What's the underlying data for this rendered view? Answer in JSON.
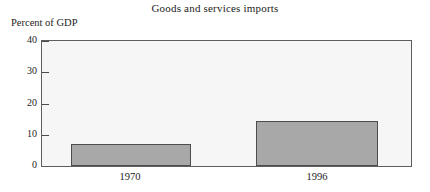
{
  "chart_data": {
    "type": "bar",
    "title": "Goods and services imports",
    "xlabel": "",
    "ylabel": "Percent of GDP",
    "categories": [
      "1970",
      "1996"
    ],
    "values": [
      7,
      14.4
    ],
    "ylim": [
      0,
      40
    ],
    "yticks": [
      0,
      10,
      20,
      30,
      40
    ],
    "ytick_labels": [
      "0",
      "10",
      "20",
      "30",
      "40"
    ],
    "grid": false,
    "legend": "none",
    "series": [
      {
        "name": "Goods and services imports",
        "values": [
          7,
          14.4
        ]
      }
    ],
    "colors": {
      "bar_fill": "#a8a8a8",
      "bar_border": "#4d4d4d",
      "plot_background": "#f6f6f6",
      "axis": "#5e5e5e",
      "text": "#1c1c1c"
    }
  }
}
